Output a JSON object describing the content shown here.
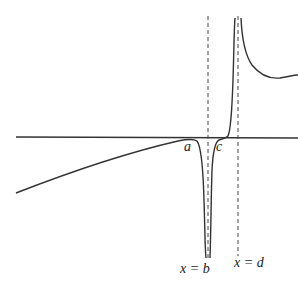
{
  "diagram": {
    "labels": {
      "a": "a",
      "c": "c",
      "asymptote_b": "x = b",
      "asymptote_d": "x = d"
    },
    "colors": {
      "curve": "#333333",
      "axis": "#333333",
      "asymptote": "#444444",
      "background": "#ffffff"
    }
  }
}
